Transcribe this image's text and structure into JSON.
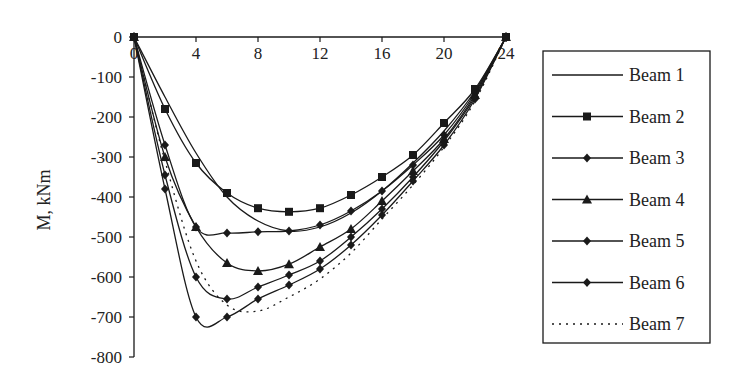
{
  "chart_data": {
    "type": "line",
    "title": "",
    "xlabel": "",
    "ylabel": "M, kNm",
    "xlim": [
      0,
      24
    ],
    "ylim": [
      -800,
      0
    ],
    "x_ticks": [
      0,
      4,
      8,
      12,
      16,
      20,
      24
    ],
    "y_ticks": [
      0,
      -100,
      -200,
      -300,
      -400,
      -500,
      -600,
      -700,
      -800
    ],
    "grid": false,
    "legend_position": "right",
    "x": [
      0,
      2,
      4,
      6,
      8,
      10,
      12,
      14,
      16,
      18,
      20,
      22,
      24
    ],
    "series": [
      {
        "name": "Beam 1",
        "marker": "none",
        "dash": "solid",
        "values": [
          0,
          -150,
          -290,
          -400,
          -460,
          -485,
          -475,
          -440,
          -385,
          -315,
          -235,
          -135,
          0
        ]
      },
      {
        "name": "Beam 2",
        "marker": "square",
        "dash": "solid",
        "values": [
          0,
          -180,
          -315,
          -390,
          -428,
          -437,
          -428,
          -395,
          -350,
          -295,
          -215,
          -130,
          0
        ]
      },
      {
        "name": "Beam 3",
        "marker": "diamond",
        "dash": "solid",
        "values": [
          0,
          -270,
          -475,
          -490,
          -487,
          -485,
          -470,
          -435,
          -385,
          -320,
          -245,
          -140,
          0
        ]
      },
      {
        "name": "Beam 4",
        "marker": "triangle",
        "dash": "solid",
        "values": [
          0,
          -300,
          -475,
          -565,
          -585,
          -568,
          -525,
          -480,
          -410,
          -335,
          -255,
          -145,
          0
        ]
      },
      {
        "name": "Beam 5",
        "marker": "diamond",
        "dash": "solid",
        "values": [
          0,
          -345,
          -600,
          -655,
          -625,
          -595,
          -560,
          -500,
          -430,
          -350,
          -260,
          -150,
          0
        ]
      },
      {
        "name": "Beam 6",
        "marker": "diamond",
        "dash": "solid",
        "values": [
          0,
          -380,
          -700,
          -700,
          -655,
          -620,
          -580,
          -520,
          -445,
          -360,
          -270,
          -155,
          0
        ]
      },
      {
        "name": "Beam 7",
        "marker": "none",
        "dash": "dotted",
        "values": [
          0,
          -310,
          -560,
          -670,
          -685,
          -650,
          -605,
          -540,
          -455,
          -370,
          -275,
          -160,
          0
        ]
      }
    ]
  },
  "axis": {
    "y_label": "M, kNm",
    "x_tick_labels": [
      "0",
      "4",
      "8",
      "12",
      "16",
      "20",
      "24"
    ],
    "y_tick_labels": [
      "0",
      "-100",
      "-200",
      "-300",
      "-400",
      "-500",
      "-600",
      "-700",
      "-800"
    ]
  },
  "legend": {
    "items": [
      "Beam 1",
      "Beam 2",
      "Beam 3",
      "Beam 4",
      "Beam 5",
      "Beam 6",
      "Beam 7"
    ]
  },
  "colors": {
    "line": "#1a1a1a",
    "background": "#ffffff"
  }
}
